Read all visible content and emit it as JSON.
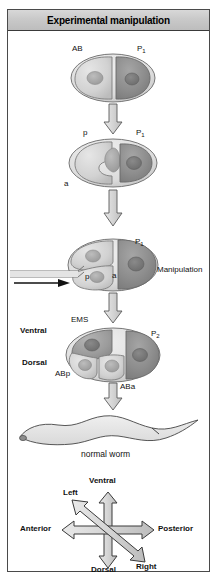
{
  "figure": {
    "header_title": "Experimental manipulation",
    "width": 218,
    "height": 581
  },
  "stages": [
    {
      "id": "two-cell",
      "labels": {
        "left_cell": "AB",
        "right_cell": "P",
        "right_cell_sub": "1"
      }
    },
    {
      "id": "ab-dividing",
      "labels": {
        "posterior": "p",
        "anterior": "a",
        "right_cell": "P",
        "right_cell_sub": "1"
      }
    },
    {
      "id": "manipulation",
      "labels": {
        "posterior": "p",
        "anterior": "a",
        "right_cell": "P",
        "right_cell_sub": "1",
        "annotation": "Manipulation"
      }
    },
    {
      "id": "four-cell",
      "labels": {
        "ems": "EMS",
        "p2": "P",
        "p2_sub": "2",
        "abp": "ABp",
        "aba": "ABa",
        "ventral": "Ventral",
        "dorsal": "Dorsal"
      }
    },
    {
      "id": "worm",
      "labels": {
        "caption": "normal worm"
      }
    }
  ],
  "axes": {
    "ventral": "Ventral",
    "dorsal": "Dorsal",
    "anterior": "Anterior",
    "posterior": "Posterior",
    "left": "Left",
    "right": "Right"
  },
  "colors": {
    "header_band": "#c9c9c9",
    "frame_stroke": "#4a4a4a",
    "ab_cell_fill": "#cfcfcf",
    "p1_cell_fill": "#8e8e8e",
    "ems_cell_fill": "#9a9a9a",
    "nucleus_fill": "#a8a8a8",
    "arrow_fill": "#d6d6d6",
    "arrow_stroke": "#555555",
    "worm_fill": "#e2e2e2",
    "text": "#111111"
  }
}
